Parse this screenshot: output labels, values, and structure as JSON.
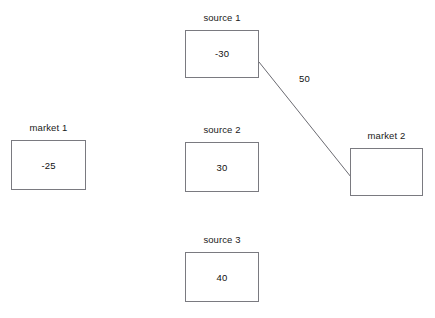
{
  "diagram": {
    "background_color": "#ffffff",
    "box_border_color": "#7a7a80",
    "text_color": "#101010",
    "nodes": [
      {
        "id": "source-1",
        "label": "source 1",
        "value": "-30",
        "x": 185,
        "y": 30,
        "width": 74,
        "height": 48
      },
      {
        "id": "market-1",
        "label": "market 1",
        "value": "-25",
        "x": 11,
        "y": 140,
        "width": 75,
        "height": 50
      },
      {
        "id": "source-2",
        "label": "source 2",
        "value": "30",
        "x": 185,
        "y": 142,
        "width": 74,
        "height": 50
      },
      {
        "id": "market-2",
        "label": "market 2",
        "value": "",
        "x": 350,
        "y": 148,
        "width": 73,
        "height": 48
      },
      {
        "id": "source-3",
        "label": "source 3",
        "value": "40",
        "x": 185,
        "y": 252,
        "width": 74,
        "height": 50
      }
    ],
    "edges": [
      {
        "id": "edge-1",
        "from": "source-1",
        "to": "market-2",
        "label": "50",
        "x1": 259,
        "y1": 62,
        "x2": 351,
        "y2": 177,
        "color": "#6b6b72"
      }
    ]
  }
}
